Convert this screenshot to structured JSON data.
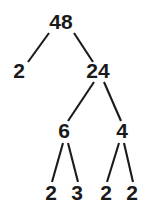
{
  "diagram": {
    "kind": "factor-tree",
    "background_color": "#ffffff",
    "ink_color": "#1a1a1a",
    "nodes": [
      {
        "id": "root",
        "label": "48",
        "x": 61,
        "y": 29,
        "level": 0
      },
      {
        "id": "n-l",
        "label": "2",
        "x": 19,
        "y": 78,
        "level": 1
      },
      {
        "id": "n-r",
        "label": "24",
        "x": 98,
        "y": 78,
        "level": 1
      },
      {
        "id": "n-rl",
        "label": "6",
        "x": 64,
        "y": 138,
        "level": 2
      },
      {
        "id": "n-rr",
        "label": "4",
        "x": 122,
        "y": 138,
        "level": 2
      },
      {
        "id": "n-rll",
        "label": "2",
        "x": 51,
        "y": 200,
        "level": 3
      },
      {
        "id": "n-rlr",
        "label": "3",
        "x": 77,
        "y": 200,
        "level": 3
      },
      {
        "id": "n-rrl",
        "label": "2",
        "x": 106,
        "y": 200,
        "level": 3
      },
      {
        "id": "n-rrr",
        "label": "2",
        "x": 132,
        "y": 200,
        "level": 3
      }
    ],
    "edges": [
      {
        "id": "e-root-l",
        "from": "root",
        "to": "n-l",
        "x1": 49,
        "y1": 33,
        "x2": 28,
        "y2": 62
      },
      {
        "id": "e-root-r",
        "from": "root",
        "to": "n-r",
        "x1": 74,
        "y1": 33,
        "x2": 93,
        "y2": 62
      },
      {
        "id": "e-r-rl",
        "from": "n-r",
        "to": "n-rl",
        "x1": 94,
        "y1": 82,
        "x2": 68,
        "y2": 121
      },
      {
        "id": "e-r-rr",
        "from": "n-r",
        "to": "n-rr",
        "x1": 104,
        "y1": 82,
        "x2": 121,
        "y2": 121
      },
      {
        "id": "e-rl-rll",
        "from": "n-rl",
        "to": "n-rll",
        "x1": 63,
        "y1": 143,
        "x2": 52,
        "y2": 182
      },
      {
        "id": "e-rl-rlr",
        "from": "n-rl",
        "to": "n-rlr",
        "x1": 68,
        "y1": 143,
        "x2": 78,
        "y2": 182
      },
      {
        "id": "e-rr-rrl",
        "from": "n-rr",
        "to": "n-rrl",
        "x1": 119,
        "y1": 143,
        "x2": 107,
        "y2": 182
      },
      {
        "id": "e-rr-rrr",
        "from": "n-rr",
        "to": "n-rrr",
        "x1": 124,
        "y1": 143,
        "x2": 133,
        "y2": 182
      }
    ]
  }
}
